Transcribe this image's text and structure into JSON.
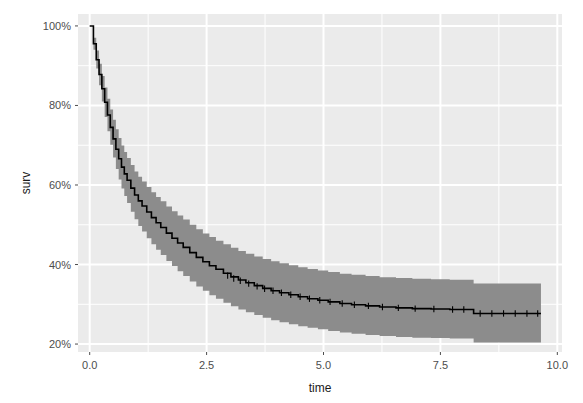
{
  "chart_data": {
    "type": "line",
    "title": "",
    "subtitle": "",
    "xlabel": "time",
    "ylabel": "surv",
    "xlim": [
      -0.25,
      10.1
    ],
    "ylim": [
      0.18,
      1.03
    ],
    "grid": true,
    "legend": false,
    "legend_position": "none",
    "x_ticks": [
      0.0,
      2.5,
      5.0,
      7.5,
      10.0
    ],
    "x_tick_labels": [
      "0.0",
      "2.5",
      "5.0",
      "7.5",
      "10.0"
    ],
    "y_ticks": [
      0.2,
      0.4,
      0.6,
      0.8,
      1.0
    ],
    "y_tick_labels": [
      "20%",
      "40%",
      "60%",
      "80%",
      "100%"
    ],
    "x_minor_ticks": [
      1.25,
      3.75,
      6.25,
      8.75
    ],
    "y_minor_ticks": [
      0.3,
      0.5,
      0.7,
      0.9
    ],
    "colors": {
      "line": "#000000",
      "band": "#8c8c8c",
      "panel_background": "#ebebeb",
      "gridline_major": "#ffffff",
      "gridline_minor": "#ffffff",
      "plot_background": "#ffffff",
      "tick_label": "#4d4d4d",
      "axis_title": "#1a1a1a"
    },
    "series": [
      {
        "name": "survival estimate",
        "type": "step",
        "x": [
          0.0,
          0.08,
          0.14,
          0.2,
          0.26,
          0.32,
          0.38,
          0.44,
          0.5,
          0.56,
          0.62,
          0.68,
          0.74,
          0.8,
          0.88,
          0.96,
          1.04,
          1.12,
          1.22,
          1.32,
          1.42,
          1.52,
          1.64,
          1.76,
          1.88,
          2.0,
          2.14,
          2.28,
          2.42,
          2.56,
          2.7,
          2.86,
          3.02,
          3.18,
          3.34,
          3.52,
          3.7,
          3.88,
          4.06,
          4.26,
          4.46,
          4.66,
          4.88,
          5.1,
          5.35,
          5.6,
          5.9,
          6.2,
          6.55,
          6.9,
          7.3,
          7.7,
          8.2,
          8.21,
          9.65
        ],
        "y": [
          1.0,
          0.955,
          0.915,
          0.878,
          0.842,
          0.808,
          0.776,
          0.745,
          0.716,
          0.69,
          0.666,
          0.645,
          0.628,
          0.612,
          0.592,
          0.575,
          0.56,
          0.547,
          0.532,
          0.518,
          0.505,
          0.493,
          0.479,
          0.466,
          0.454,
          0.443,
          0.43,
          0.418,
          0.407,
          0.397,
          0.388,
          0.378,
          0.369,
          0.361,
          0.354,
          0.347,
          0.34,
          0.334,
          0.329,
          0.324,
          0.319,
          0.314,
          0.31,
          0.306,
          0.302,
          0.299,
          0.296,
          0.293,
          0.291,
          0.289,
          0.288,
          0.287,
          0.287,
          0.277,
          0.277
        ]
      }
    ],
    "confidence_band": {
      "name": "95% confidence interval",
      "x": [
        0.0,
        0.08,
        0.14,
        0.2,
        0.26,
        0.32,
        0.38,
        0.44,
        0.5,
        0.56,
        0.62,
        0.68,
        0.74,
        0.8,
        0.88,
        0.96,
        1.04,
        1.12,
        1.22,
        1.32,
        1.42,
        1.52,
        1.64,
        1.76,
        1.88,
        2.0,
        2.14,
        2.28,
        2.42,
        2.56,
        2.7,
        2.86,
        3.02,
        3.18,
        3.34,
        3.52,
        3.7,
        3.88,
        4.06,
        4.26,
        4.46,
        4.66,
        4.88,
        5.1,
        5.35,
        5.6,
        5.9,
        6.2,
        6.55,
        6.9,
        7.3,
        7.7,
        8.2,
        8.21,
        9.65
      ],
      "lower": [
        1.0,
        0.94,
        0.893,
        0.851,
        0.81,
        0.771,
        0.735,
        0.701,
        0.669,
        0.64,
        0.614,
        0.591,
        0.572,
        0.555,
        0.533,
        0.514,
        0.497,
        0.483,
        0.466,
        0.451,
        0.437,
        0.424,
        0.409,
        0.396,
        0.383,
        0.371,
        0.357,
        0.345,
        0.334,
        0.323,
        0.314,
        0.304,
        0.295,
        0.287,
        0.28,
        0.273,
        0.266,
        0.26,
        0.255,
        0.25,
        0.245,
        0.241,
        0.237,
        0.233,
        0.229,
        0.226,
        0.223,
        0.22,
        0.218,
        0.216,
        0.215,
        0.214,
        0.214,
        0.204,
        0.204
      ],
      "upper": [
        1.0,
        0.97,
        0.938,
        0.905,
        0.874,
        0.845,
        0.817,
        0.79,
        0.764,
        0.74,
        0.718,
        0.699,
        0.683,
        0.668,
        0.65,
        0.634,
        0.621,
        0.609,
        0.595,
        0.582,
        0.57,
        0.559,
        0.546,
        0.534,
        0.523,
        0.513,
        0.5,
        0.489,
        0.478,
        0.469,
        0.46,
        0.451,
        0.442,
        0.434,
        0.427,
        0.42,
        0.414,
        0.408,
        0.403,
        0.398,
        0.393,
        0.389,
        0.385,
        0.381,
        0.377,
        0.374,
        0.371,
        0.368,
        0.366,
        0.364,
        0.363,
        0.362,
        0.362,
        0.352,
        0.352
      ]
    },
    "censor_marks": {
      "name": "censoring ticks",
      "x": [
        2.95,
        3.08,
        3.22,
        3.4,
        3.58,
        3.74,
        3.92,
        4.1,
        4.3,
        4.5,
        4.7,
        4.92,
        5.14,
        5.4,
        5.66,
        5.96,
        6.26,
        6.6,
        6.96,
        7.36,
        7.76,
        8.0,
        8.35,
        8.6,
        8.85,
        9.1,
        9.35,
        9.58
      ],
      "y": [
        0.372,
        0.365,
        0.359,
        0.352,
        0.345,
        0.339,
        0.334,
        0.329,
        0.324,
        0.319,
        0.314,
        0.31,
        0.306,
        0.302,
        0.299,
        0.296,
        0.293,
        0.291,
        0.289,
        0.288,
        0.287,
        0.287,
        0.277,
        0.277,
        0.277,
        0.277,
        0.277,
        0.277
      ]
    }
  }
}
